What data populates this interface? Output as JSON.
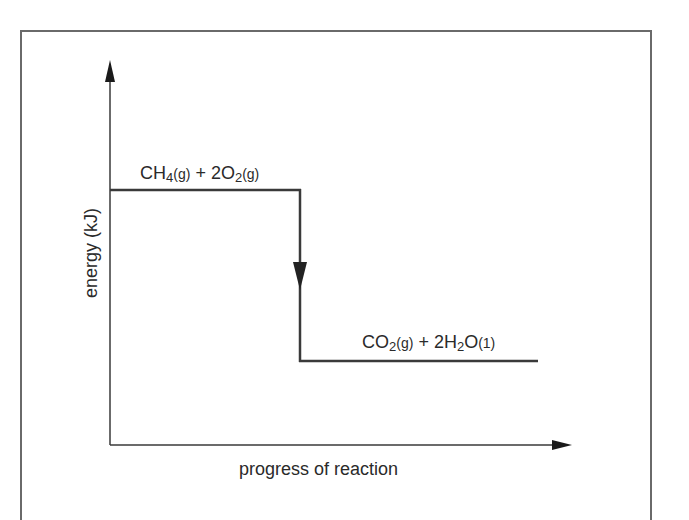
{
  "diagram": {
    "type": "energy-level diagram (exothermic reaction)",
    "y_axis_label": "energy (kJ)",
    "x_axis_label": "progress of reaction",
    "reactants": {
      "species": [
        {
          "formula": "CH",
          "subscript": "4",
          "state": "(g)"
        },
        {
          "coefficient": "2",
          "formula": "O",
          "subscript": "2",
          "state": "(g)"
        }
      ],
      "plus": "+",
      "text": "CH4(g) + 2O2(g)"
    },
    "products": {
      "species": [
        {
          "formula": "CO",
          "subscript": "2",
          "state": "(g)"
        },
        {
          "coefficient": "2",
          "formula": "H",
          "subscript": "2",
          "formula2": "O",
          "state": "(1)"
        }
      ],
      "plus": "+",
      "text": "CO2(g) + 2H2O(1)"
    },
    "arrow_direction": "down",
    "colors": {
      "line": "#3a3a3a",
      "frame": "#6a6a6a",
      "text": "#2a2a2a",
      "background": "#ffffff"
    }
  }
}
